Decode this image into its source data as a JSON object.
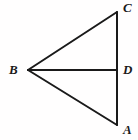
{
  "figure": {
    "kind": "geometry-diagram",
    "background_color": "#fffefe",
    "stroke_color": "#1a1a1a",
    "stroke_width": 2,
    "canvas": {
      "width": 138,
      "height": 140
    },
    "points": [
      {
        "id": "B",
        "label": "B",
        "x": 28,
        "y": 70,
        "label_x": 9,
        "label_y": 63
      },
      {
        "id": "C",
        "label": "C",
        "x": 117,
        "y": 12,
        "label_x": 123,
        "label_y": 1
      },
      {
        "id": "D",
        "label": "D",
        "x": 117,
        "y": 70,
        "label_x": 123,
        "label_y": 63
      },
      {
        "id": "A",
        "label": "A",
        "x": 117,
        "y": 125,
        "label_x": 123,
        "label_y": 123
      }
    ],
    "segments": [
      {
        "id": "BC",
        "from": "B",
        "to": "C",
        "x1": 28,
        "y1": 70,
        "x2": 117,
        "y2": 12
      },
      {
        "id": "CA",
        "from": "C",
        "to": "A",
        "x1": 117,
        "y1": 12,
        "x2": 117,
        "y2": 125
      },
      {
        "id": "AB",
        "from": "A",
        "to": "B",
        "x1": 117,
        "y1": 125,
        "x2": 28,
        "y2": 70
      },
      {
        "id": "BD",
        "from": "B",
        "to": "D",
        "x1": 28,
        "y1": 70,
        "x2": 117,
        "y2": 70
      }
    ]
  }
}
